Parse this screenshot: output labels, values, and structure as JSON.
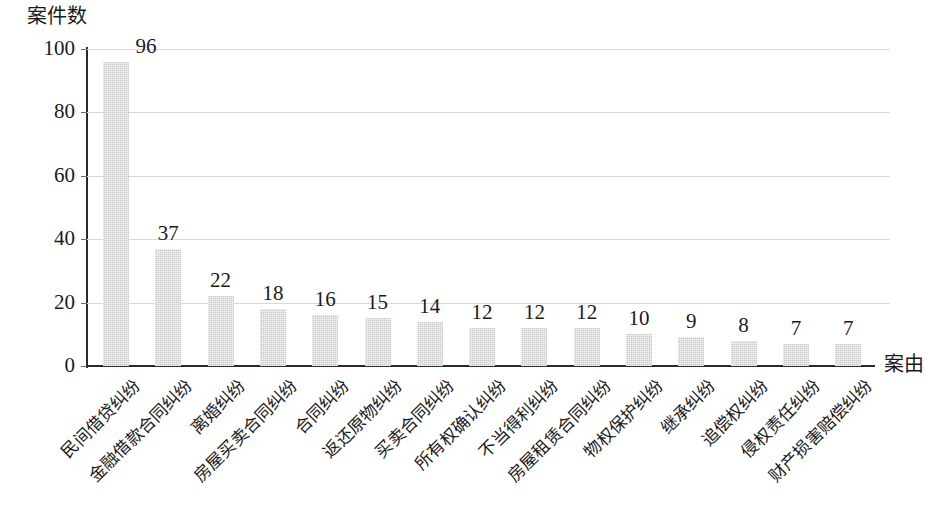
{
  "chart_data": {
    "type": "bar",
    "title": "",
    "xlabel": "案由",
    "ylabel": "案件数",
    "ylim": [
      0,
      100
    ],
    "yticks": [
      0,
      20,
      40,
      60,
      80,
      100
    ],
    "grid": true,
    "legend": "none",
    "orientation": "vertical",
    "bar_color": "#c9c9c9",
    "categories": [
      "民间借贷纠纷",
      "金融借款合同纠纷",
      "离婚纠纷",
      "房屋买卖合同纠纷",
      "合同纠纷",
      "返还原物纠纷",
      "买卖合同纠纷",
      "所有权确认纠纷",
      "不当得利纠纷",
      "房屋租赁合同纠纷",
      "物权保护纠纷",
      "继承纠纷",
      "追偿权纠纷",
      "侵权责任纠纷",
      "财产损害赔偿纠纷"
    ],
    "values": [
      96,
      37,
      22,
      18,
      16,
      15,
      14,
      12,
      12,
      12,
      10,
      9,
      8,
      7,
      7
    ],
    "value_labels": [
      "96",
      "37",
      "22",
      "18",
      "16",
      "15",
      "14",
      "12",
      "12",
      "12",
      "10",
      "9",
      "8",
      "7",
      "7"
    ],
    "ytick_labels": [
      "0",
      "20",
      "40",
      "60",
      "80",
      "100"
    ]
  }
}
